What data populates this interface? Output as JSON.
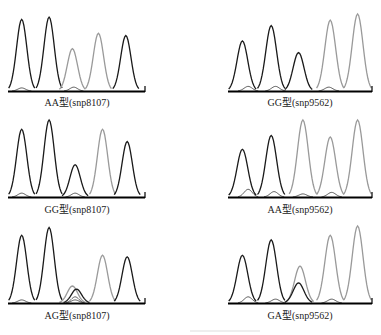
{
  "figure": {
    "colors": {
      "dark_trace": "#1a1a1a",
      "light_trace": "#9a9a9a",
      "baseline": "#000000",
      "minor_trace": "#555555"
    },
    "panels": [
      {
        "id": "aa-snp8107",
        "label": "AA型(snp8107)",
        "column": "left",
        "row": 1,
        "peaks": [
          {
            "pos": 0.1,
            "height": 0.93,
            "tone": "dark"
          },
          {
            "pos": 0.3,
            "height": 0.96,
            "tone": "dark"
          },
          {
            "pos": 0.47,
            "height": 0.55,
            "tone": "light"
          },
          {
            "pos": 0.66,
            "height": 0.75,
            "tone": "light"
          },
          {
            "pos": 0.86,
            "height": 0.72,
            "tone": "dark"
          }
        ],
        "minor": [
          {
            "pos": 0.1,
            "height": 0.04
          },
          {
            "pos": 0.48,
            "height": 0.05
          }
        ]
      },
      {
        "id": "gg-snp9562",
        "label": "GG型(snp9562)",
        "column": "right",
        "row": 1,
        "peaks": [
          {
            "pos": 0.1,
            "height": 0.65,
            "tone": "dark"
          },
          {
            "pos": 0.3,
            "height": 0.85,
            "tone": "dark"
          },
          {
            "pos": 0.49,
            "height": 0.5,
            "tone": "dark"
          },
          {
            "pos": 0.71,
            "height": 0.92,
            "tone": "light"
          },
          {
            "pos": 0.9,
            "height": 1.0,
            "tone": "light"
          }
        ],
        "minor": [
          {
            "pos": 0.14,
            "height": 0.06
          },
          {
            "pos": 0.33,
            "height": 0.06
          },
          {
            "pos": 0.7,
            "height": 0.05
          }
        ]
      },
      {
        "id": "gg-snp8107",
        "label": "GG型(snp8107)",
        "column": "left",
        "row": 2,
        "peaks": [
          {
            "pos": 0.1,
            "height": 0.88,
            "tone": "dark"
          },
          {
            "pos": 0.3,
            "height": 1.0,
            "tone": "dark"
          },
          {
            "pos": 0.49,
            "height": 0.42,
            "tone": "dark"
          },
          {
            "pos": 0.69,
            "height": 0.88,
            "tone": "light"
          },
          {
            "pos": 0.87,
            "height": 0.72,
            "tone": "dark"
          }
        ],
        "minor": [
          {
            "pos": 0.1,
            "height": 0.05
          },
          {
            "pos": 0.49,
            "height": 0.05
          }
        ]
      },
      {
        "id": "aa-snp9562",
        "label": "AA型(snp9562)",
        "column": "right",
        "row": 2,
        "peaks": [
          {
            "pos": 0.1,
            "height": 0.62,
            "tone": "dark"
          },
          {
            "pos": 0.3,
            "height": 0.8,
            "tone": "dark"
          },
          {
            "pos": 0.52,
            "height": 1.0,
            "tone": "light"
          },
          {
            "pos": 0.71,
            "height": 0.78,
            "tone": "light"
          },
          {
            "pos": 0.9,
            "height": 1.0,
            "tone": "light"
          }
        ],
        "minor": [
          {
            "pos": 0.14,
            "height": 0.1
          },
          {
            "pos": 0.32,
            "height": 0.07
          },
          {
            "pos": 0.52,
            "height": 0.04
          },
          {
            "pos": 0.72,
            "height": 0.06
          }
        ]
      },
      {
        "id": "ag-snp8107",
        "label": "AG型(snp8107)",
        "column": "left",
        "row": 3,
        "peaks": [
          {
            "pos": 0.1,
            "height": 0.88,
            "tone": "dark"
          },
          {
            "pos": 0.3,
            "height": 0.98,
            "tone": "dark"
          },
          {
            "pos": 0.47,
            "height": 0.22,
            "tone": "light"
          },
          {
            "pos": 0.5,
            "height": 0.18,
            "tone": "dark"
          },
          {
            "pos": 0.69,
            "height": 0.62,
            "tone": "light"
          },
          {
            "pos": 0.87,
            "height": 0.6,
            "tone": "dark"
          }
        ],
        "minor": [
          {
            "pos": 0.1,
            "height": 0.04
          },
          {
            "pos": 0.49,
            "height": 0.08
          },
          {
            "pos": 0.49,
            "height": 0.04
          }
        ]
      },
      {
        "id": "ga-snp9562",
        "label": "GA型(snp9562)",
        "column": "right",
        "row": 3,
        "peaks": [
          {
            "pos": 0.1,
            "height": 0.62,
            "tone": "dark"
          },
          {
            "pos": 0.3,
            "height": 0.82,
            "tone": "dark"
          },
          {
            "pos": 0.5,
            "height": 0.48,
            "tone": "light"
          },
          {
            "pos": 0.49,
            "height": 0.26,
            "tone": "dark"
          },
          {
            "pos": 0.71,
            "height": 0.88,
            "tone": "light"
          },
          {
            "pos": 0.9,
            "height": 1.0,
            "tone": "light"
          }
        ],
        "minor": [
          {
            "pos": 0.14,
            "height": 0.08
          },
          {
            "pos": 0.33,
            "height": 0.05
          },
          {
            "pos": 0.72,
            "height": 0.05
          }
        ]
      }
    ]
  }
}
